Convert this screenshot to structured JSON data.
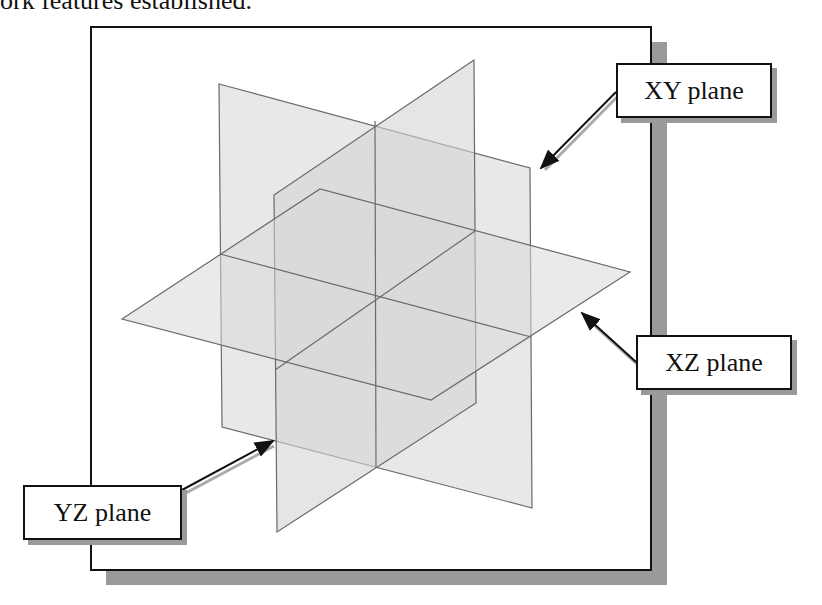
{
  "caption_fragment": "ork features established.",
  "diagram": {
    "planes": [
      {
        "name": "XY plane",
        "fill": "#d9d9d9"
      },
      {
        "name": "YZ plane",
        "fill": "#cfcfcf"
      },
      {
        "name": "XZ plane",
        "fill": "#dedede"
      }
    ],
    "labels": {
      "xy": "XY plane",
      "xz": "XZ plane",
      "yz": "YZ plane"
    },
    "colors": {
      "frame": "#111111",
      "shadow": "#9a9a9a",
      "edge": "#6a6a6a",
      "arrow": "#111111"
    }
  }
}
